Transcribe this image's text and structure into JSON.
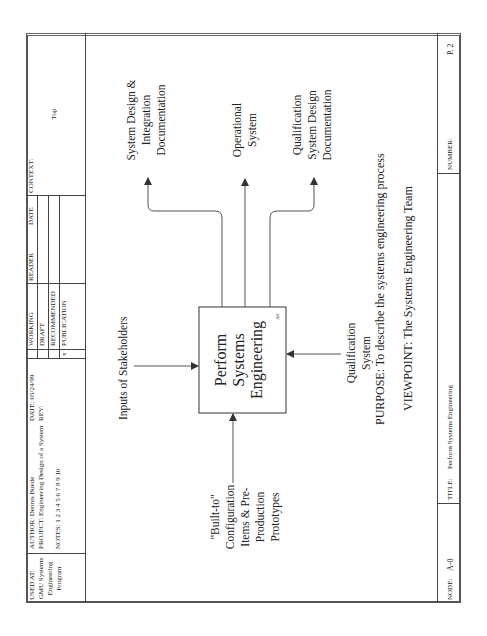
{
  "header": {
    "used_at_label": "USED AT:",
    "used_at_lines": [
      "GMU Systems",
      "Engineering",
      "Program"
    ],
    "author_label": "AUTHOR:",
    "author": "Dennis Buede",
    "project_label": "PROJECT:",
    "project": "Engineering Design of a System",
    "date_label": "DATE:",
    "date": "05/24/99",
    "rev_label": "REV:",
    "notes_label": "NOTES:",
    "notes": "1 2 3 4 5 6 7 8 9 10",
    "status_rows": [
      {
        "mark": "",
        "label": "WORKING"
      },
      {
        "mark": "",
        "label": "DRAFT"
      },
      {
        "mark": "",
        "label": "RECOMMENDED"
      },
      {
        "mark": "x",
        "label": "PUBLICATION"
      }
    ],
    "reader_label": "READER",
    "reader_date_label": "DATE",
    "context_label": "CONTEXT:",
    "context": "Top"
  },
  "diagram": {
    "box": {
      "title_lines": [
        "Perform",
        "Systems",
        "Engineering"
      ],
      "node_id": "A0"
    },
    "inputs": [
      {
        "lines": [
          "\"Built-to\"",
          "Configuration",
          "Items & Pre-",
          "Production",
          "Prototypes"
        ]
      }
    ],
    "controls": [
      {
        "label": "Inputs of Stakeholders"
      }
    ],
    "mechanisms": [
      {
        "lines": [
          "Qualification",
          "System"
        ]
      }
    ],
    "outputs": [
      {
        "lines": [
          "System Design &",
          "Integration",
          "Documentation"
        ]
      },
      {
        "lines": [
          "Operational",
          "System"
        ]
      },
      {
        "lines": [
          "Qualification",
          "System Design",
          "Documentation"
        ]
      }
    ],
    "purpose": "PURPOSE: To describe the systems engineering process",
    "viewpoint": "VIEWPOINT: The Systems Engineering Team"
  },
  "footer": {
    "node_label": "NODE:",
    "node": "A-0",
    "title_label": "TITLE:",
    "title": "Perform Systems Engineering",
    "number_label": "NUMBER:",
    "number": "P. 2"
  },
  "colors": {
    "line": "#444444",
    "text": "#222222",
    "background": "#ffffff"
  }
}
